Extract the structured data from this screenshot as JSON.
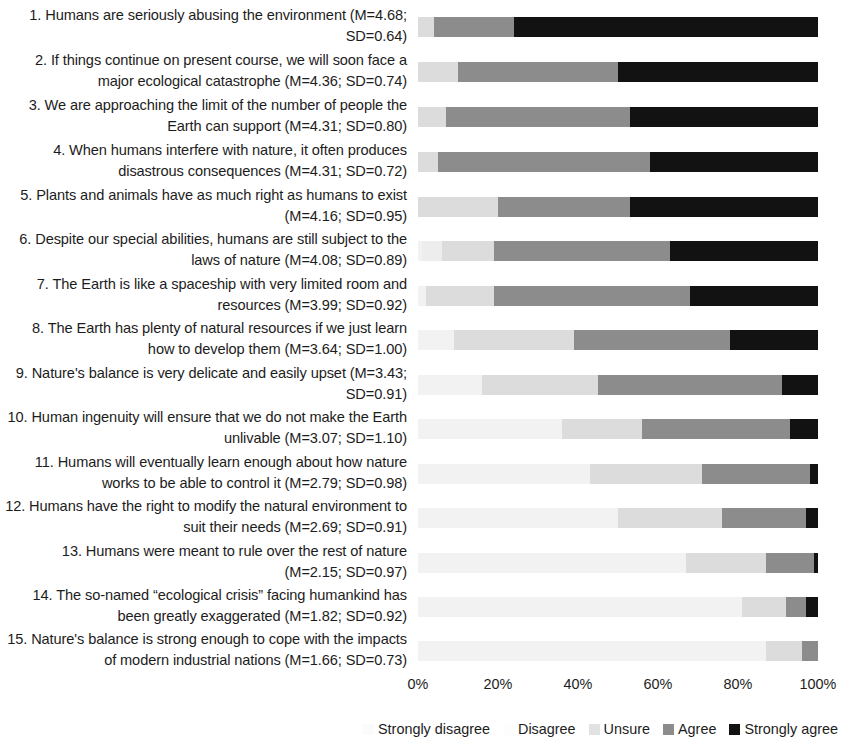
{
  "chart_data": {
    "type": "bar",
    "subtype": "stacked-horizontal-100pct",
    "title": "",
    "xlabel": "",
    "ylabel": "",
    "xlim": [
      0,
      100
    ],
    "xticks": [
      "0%",
      "20%",
      "40%",
      "60%",
      "80%",
      "100%"
    ],
    "grid": false,
    "legend_position": "bottom-right",
    "series_names": [
      "Strongly disagree",
      "Disagree",
      "Unsure",
      "Agree",
      "Strongly agree"
    ],
    "categories": [
      "1. Humans are seriously abusing the environment (M=4.68; SD=0.64)",
      "2. If things continue on present course, we will soon face a major ecological catastrophe (M=4.36; SD=0.74)",
      "3. We are approaching the limit of the number of people the Earth can support (M=4.31; SD=0.80)",
      "4. When humans interfere with nature, it often produces disastrous consequences (M=4.31; SD=0.72)",
      "5. Plants and animals have as much right as humans to exist (M=4.16; SD=0.95)",
      "6. Despite our special abilities, humans are still subject to the laws of nature (M=4.08; SD=0.89)",
      "7. The Earth is like a spaceship with very limited room and resources (M=3.99; SD=0.92)",
      "8. The Earth has plenty of natural resources if we just learn how to develop them (M=3.64; SD=1.00)",
      "9. Nature's balance is very delicate and easily upset (M=3.43; SD=0.91)",
      "10. Human ingenuity will ensure that we do not make the Earth unlivable (M=3.07; SD=1.10)",
      "11. Humans will eventually learn enough about how nature works to be able to control it (M=2.79; SD=0.98)",
      "12. Humans have the right to modify the natural environment to suit their needs (M=2.69; SD=0.91)",
      "13. Humans were meant to rule over the rest of nature (M=2.15; SD=0.97)",
      "14. The so-named “ecological crisis” facing humankind has been greatly exaggerated (M=1.82; SD=0.92)",
      "15. Nature's balance is strong enough to cope with the impacts of modern industrial nations (M=1.66; SD=0.73)"
    ],
    "series": [
      {
        "name": "Strongly disagree",
        "values": [
          0,
          0,
          0,
          0,
          0,
          1,
          2,
          9,
          16,
          36,
          43,
          50,
          67,
          81,
          87
        ]
      },
      {
        "name": "Disagree",
        "values": [
          0,
          0,
          0,
          0,
          0,
          5,
          0,
          0,
          0,
          0,
          0,
          0,
          0,
          0,
          0
        ]
      },
      {
        "name": "Unsure",
        "values": [
          4,
          10,
          7,
          5,
          20,
          13,
          17,
          30,
          29,
          20,
          28,
          26,
          20,
          11,
          9
        ]
      },
      {
        "name": "Agree",
        "values": [
          20,
          40,
          46,
          53,
          33,
          44,
          49,
          39,
          46,
          37,
          27,
          21,
          12,
          5,
          4
        ]
      },
      {
        "name": "Strongly agree",
        "values": [
          76,
          50,
          47,
          42,
          47,
          37,
          32,
          22,
          9,
          7,
          2,
          3,
          1,
          3,
          0
        ]
      }
    ],
    "colors": {
      "strongly_disagree": "#f2f2f2",
      "disagree": "#ededed",
      "unsure": "#dcdcdc",
      "agree": "#8c8c8c",
      "strongly_agree": "#121212"
    }
  },
  "legend": {
    "items": [
      {
        "label": "Strongly disagree",
        "key": "sd"
      },
      {
        "label": "Disagree",
        "key": "d"
      },
      {
        "label": "Unsure",
        "key": "u"
      },
      {
        "label": "Agree",
        "key": "a"
      },
      {
        "label": "Strongly agree",
        "key": "sa"
      }
    ]
  },
  "axis": {
    "ticks": [
      {
        "label": "0%",
        "value": 0
      },
      {
        "label": "20%",
        "value": 20
      },
      {
        "label": "40%",
        "value": 40
      },
      {
        "label": "60%",
        "value": 60
      },
      {
        "label": "80%",
        "value": 80
      },
      {
        "label": "100%",
        "value": 100
      }
    ]
  }
}
